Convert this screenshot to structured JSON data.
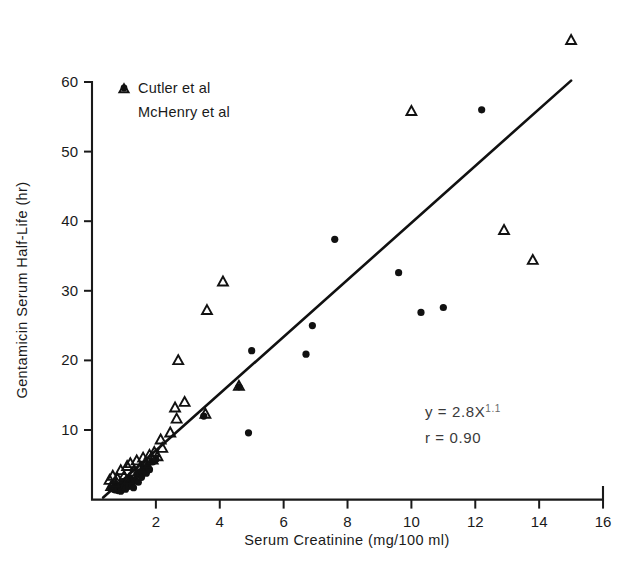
{
  "figure": {
    "background": "#ffffff",
    "ink_color": "#111111"
  },
  "chart_data": {
    "type": "scatter",
    "title": "",
    "xlabel": "Serum Creatinine  (mg/100 ml)",
    "ylabel": "Gentamicin Serum Half-Life  (hr)",
    "xlim": [
      0,
      16
    ],
    "ylim": [
      0,
      62
    ],
    "xticks": [
      2,
      4,
      6,
      8,
      10,
      12,
      14,
      16
    ],
    "yticks": [
      10,
      20,
      30,
      40,
      50,
      60
    ],
    "grid": false,
    "legend_position": "top-left",
    "legend": [
      {
        "label": "Cutler et al",
        "marker": "filled-circle"
      },
      {
        "label": "McHenry et al",
        "marker": "open-triangle"
      }
    ],
    "annotations": [
      {
        "text": "y = 2.8X",
        "exponent": "1.1",
        "x": 8.3,
        "y": 13.2
      },
      {
        "text": "r = 0.90",
        "x": 8.3,
        "y": 10.3
      }
    ],
    "fit_line": {
      "label": "y = 2.8X^1.1",
      "equation": "y = 2.8X1.1",
      "correlation": 0.9,
      "x_start": 0.35,
      "y_start": 0.3,
      "x_end": 15.0,
      "y_end": 60.2
    },
    "series": [
      {
        "name": "Cutler et al",
        "marker": "filled-circle",
        "points": [
          [
            0.6,
            1.6
          ],
          [
            0.7,
            1.4
          ],
          [
            0.75,
            2.2
          ],
          [
            0.8,
            1.3
          ],
          [
            0.85,
            2.0
          ],
          [
            0.9,
            1.2
          ],
          [
            0.95,
            2.6
          ],
          [
            1.0,
            1.8
          ],
          [
            1.05,
            1.5
          ],
          [
            1.1,
            2.4
          ],
          [
            1.15,
            1.9
          ],
          [
            1.2,
            3.0
          ],
          [
            1.25,
            2.2
          ],
          [
            1.3,
            1.7
          ],
          [
            1.35,
            2.8
          ],
          [
            1.4,
            3.6
          ],
          [
            1.45,
            2.5
          ],
          [
            1.5,
            4.0
          ],
          [
            1.55,
            3.2
          ],
          [
            1.6,
            4.6
          ],
          [
            1.7,
            3.8
          ],
          [
            1.75,
            5.0
          ],
          [
            1.8,
            4.3
          ],
          [
            1.9,
            5.4
          ],
          [
            2.0,
            5.8
          ],
          [
            3.5,
            12.0
          ],
          [
            4.6,
            16.2
          ],
          [
            4.9,
            9.6
          ],
          [
            5.0,
            21.4
          ],
          [
            6.7,
            20.9
          ],
          [
            6.9,
            25.0
          ],
          [
            7.6,
            37.4
          ],
          [
            9.6,
            32.6
          ],
          [
            10.3,
            26.9
          ],
          [
            11.0,
            27.6
          ],
          [
            12.2,
            56.0
          ]
        ]
      },
      {
        "name": "McHenry et al",
        "marker": "open-triangle",
        "points": [
          [
            0.55,
            2.8
          ],
          [
            0.6,
            1.9
          ],
          [
            0.65,
            3.4
          ],
          [
            0.7,
            2.4
          ],
          [
            0.8,
            3.0
          ],
          [
            0.9,
            4.2
          ],
          [
            1.0,
            3.3
          ],
          [
            1.1,
            4.8
          ],
          [
            1.15,
            2.9
          ],
          [
            1.2,
            5.2
          ],
          [
            1.3,
            4.0
          ],
          [
            1.4,
            5.6
          ],
          [
            1.5,
            4.5
          ],
          [
            1.6,
            6.0
          ],
          [
            1.7,
            5.1
          ],
          [
            1.8,
            6.4
          ],
          [
            1.9,
            5.7
          ],
          [
            1.95,
            6.8
          ],
          [
            2.05,
            6.2
          ],
          [
            2.15,
            8.6
          ],
          [
            2.2,
            7.4
          ],
          [
            2.45,
            9.6
          ],
          [
            2.6,
            13.2
          ],
          [
            2.65,
            11.6
          ],
          [
            2.7,
            20.0
          ],
          [
            2.9,
            14.0
          ],
          [
            3.55,
            12.3
          ],
          [
            3.6,
            27.2
          ],
          [
            4.1,
            31.3
          ],
          [
            4.6,
            16.3
          ],
          [
            10.0,
            55.8
          ],
          [
            12.9,
            38.7
          ],
          [
            13.8,
            34.4
          ],
          [
            15.0,
            66.0
          ]
        ]
      }
    ]
  }
}
